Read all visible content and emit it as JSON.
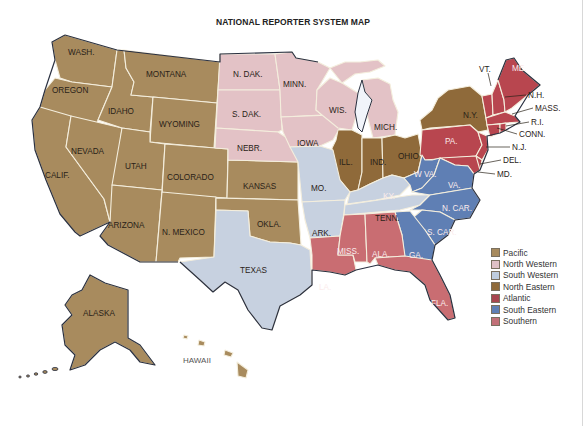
{
  "title": "NATIONAL REPORTER SYSTEM MAP",
  "colors": {
    "pacific": "#a88b5e",
    "north_western": "#e6c4c7",
    "south_western": "#c7d0de",
    "north_eastern": "#8f6a3a",
    "atlantic": "#b8464f",
    "south_eastern": "#5f7fb4",
    "southern": "#c96d72",
    "water": "#ffffff",
    "coastline": "#2a3040"
  },
  "legend": [
    {
      "label": "Pacific",
      "color": "#a88b5e"
    },
    {
      "label": "North Western",
      "color": "#dfc0c6"
    },
    {
      "label": "South Western",
      "color": "#bfcde0"
    },
    {
      "label": "North Eastern",
      "color": "#8f6a3a"
    },
    {
      "label": "Atlantic",
      "color": "#a8464f"
    },
    {
      "label": "South Eastern",
      "color": "#5f7fb4"
    },
    {
      "label": "Southern",
      "color": "#c27078"
    }
  ],
  "states": {
    "wash": "WASH.",
    "oregon": "OREGON",
    "calif": "CALIF.",
    "nevada": "NEVADA",
    "idaho": "IDAHO",
    "montana": "MONTANA",
    "wyoming": "WYOMING",
    "utah": "UTAH",
    "colorado": "COLORADO",
    "arizona": "ARIZONA",
    "n_mexico": "N. MEXICO",
    "kansas": "KANSAS",
    "okla": "OKLA.",
    "alaska": "ALASKA",
    "hawaii": "HAWAII",
    "n_dak": "N. DAK.",
    "s_dak": "S. DAK.",
    "nebr": "NEBR.",
    "minn": "MINN.",
    "iowa": "IOWA",
    "wis": "WIS.",
    "mich": "MICH.",
    "ill": "ILL.",
    "ind": "IND.",
    "ohio": "OHIO",
    "ny": "N.Y.",
    "vt": "VT.",
    "me": "ME.",
    "nh": "N.H.",
    "mass": "MASS.",
    "ri": "R.I.",
    "conn": "CONN.",
    "nj": "N.J.",
    "pa": "PA.",
    "del": "DEL.",
    "md": "MD.",
    "texas": "TEXAS",
    "ark": "ARK.",
    "mo": "MO.",
    "ky": "KY.",
    "tenn": "TENN.",
    "la": "LA.",
    "miss": "MISS.",
    "ala": "ALA.",
    "fla": "FLA.",
    "ga": "GA.",
    "s_car": "S. CAR.",
    "n_car": "N. CAR.",
    "va": "VA.",
    "w_va": "W VA."
  }
}
